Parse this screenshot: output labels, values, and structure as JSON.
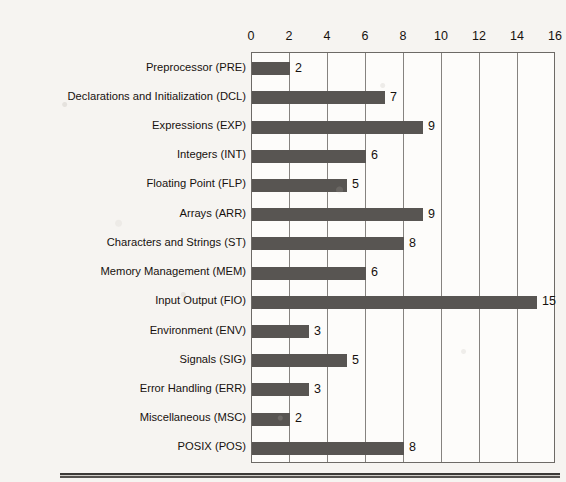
{
  "chart_data": {
    "type": "bar",
    "orientation": "horizontal",
    "title": "",
    "xlabel": "",
    "ylabel": "",
    "xlim": [
      0,
      16
    ],
    "xticks": [
      0,
      2,
      4,
      6,
      8,
      10,
      12,
      14,
      16
    ],
    "grid": true,
    "legend": false,
    "axis_position": "top",
    "bar_color": "#585552",
    "plot_background": "#fdfcfa",
    "page_background": "#f6f4f1",
    "categories": [
      "Preprocessor (PRE)",
      "Declarations and Initialization (DCL)",
      "Expressions (EXP)",
      "Integers (INT)",
      "Floating Point (FLP)",
      "Arrays (ARR)",
      "Characters and Strings (ST)",
      "Memory Management (MEM)",
      "Input Output (FIO)",
      "Environment (ENV)",
      "Signals (SIG)",
      "Error Handling (ERR)",
      "Miscellaneous (MSC)",
      "POSIX (POS)"
    ],
    "values": [
      2,
      7,
      9,
      6,
      5,
      9,
      8,
      6,
      15,
      3,
      5,
      3,
      2,
      8
    ],
    "value_labels": [
      "2",
      "7",
      "9",
      "6",
      "5",
      "9",
      "8",
      "6",
      "15",
      "3",
      "5",
      "3",
      "2",
      "8"
    ],
    "tick_labels": [
      "0",
      "2",
      "4",
      "6",
      "8",
      "10",
      "12",
      "14",
      "16"
    ]
  }
}
